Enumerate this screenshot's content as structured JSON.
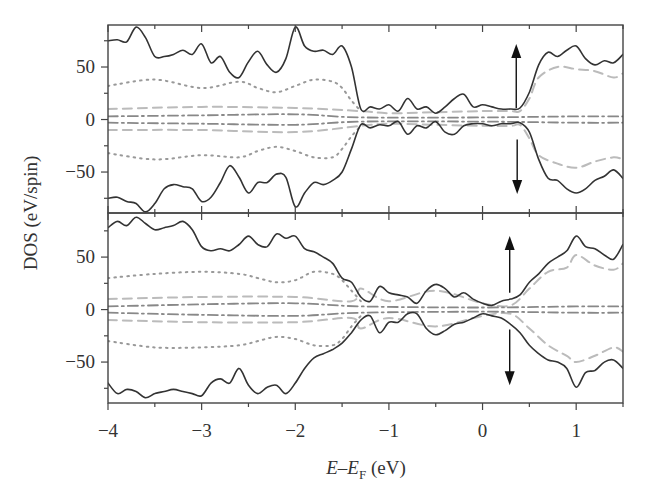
{
  "chart_data": {
    "type": "line",
    "title": "",
    "xlabel": "E–E_F (eV)",
    "xlabel_parts": {
      "e": "E",
      "dash": "–",
      "ef": "E",
      "sub": "F",
      "unit": " (eV)"
    },
    "ylabel": "DOS (eV/spin)",
    "xlim": [
      -4,
      1.5
    ],
    "x_ticks": [
      -4,
      -3,
      -2,
      -1,
      0,
      1
    ],
    "x_tick_labels": [
      "−4",
      "−3",
      "−2",
      "−1",
      "0",
      "1"
    ],
    "grid": false,
    "legend": null,
    "panels": [
      {
        "name": "top",
        "ylim": [
          -89,
          90
        ],
        "y_ticks": [
          50,
          0,
          -50
        ],
        "y_tick_labels": [
          "50",
          "0",
          "−50"
        ],
        "annotations": [
          {
            "type": "arrow-up",
            "x": 0.36,
            "y_from": 11,
            "y_to": 72,
            "label": "spin up"
          },
          {
            "type": "arrow-down",
            "x": 0.37,
            "y_from": -19,
            "y_to": -71,
            "label": "spin down"
          }
        ],
        "series": [
          {
            "name": "total",
            "style": "solid",
            "color": "#333333",
            "x": [
              -4,
              -3.9,
              -3.8,
              -3.7,
              -3.6,
              -3.5,
              -3.4,
              -3.3,
              -3.2,
              -3.1,
              -3.0,
              -2.9,
              -2.8,
              -2.7,
              -2.6,
              -2.5,
              -2.4,
              -2.3,
              -2.2,
              -2.1,
              -2.0,
              -1.9,
              -1.8,
              -1.7,
              -1.6,
              -1.5,
              -1.4,
              -1.3,
              -1.2,
              -1.1,
              -1.0,
              -0.9,
              -0.8,
              -0.7,
              -0.6,
              -0.5,
              -0.4,
              -0.3,
              -0.2,
              -0.1,
              0.0,
              0.1,
              0.2,
              0.3,
              0.4,
              0.5,
              0.6,
              0.7,
              0.8,
              0.9,
              1.0,
              1.1,
              1.2,
              1.3,
              1.4,
              1.5
            ],
            "up": [
              75,
              76,
              74,
              88,
              78,
              60,
              60,
              62,
              66,
              62,
              72,
              54,
              60,
              45,
              40,
              55,
              65,
              52,
              45,
              58,
              88,
              70,
              65,
              66,
              62,
              70,
              50,
              10,
              12,
              10,
              14,
              8,
              20,
              10,
              12,
              6,
              12,
              20,
              24,
              12,
              14,
              12,
              10,
              10,
              11,
              26,
              52,
              64,
              60,
              66,
              70,
              58,
              52,
              56,
              54,
              62
            ],
            "down": [
              -75,
              -74,
              -78,
              -80,
              -88,
              -80,
              -66,
              -62,
              -64,
              -66,
              -78,
              -74,
              -60,
              -44,
              -55,
              -70,
              -60,
              -60,
              -52,
              -55,
              -83,
              -70,
              -60,
              -62,
              -58,
              -50,
              -28,
              -5,
              -8,
              -5,
              -6,
              -2,
              -14,
              -6,
              -8,
              -2,
              -12,
              -14,
              -6,
              -4,
              -4,
              -6,
              -4,
              -4,
              -3,
              -12,
              -38,
              -56,
              -58,
              -66,
              -70,
              -66,
              -58,
              -54,
              -48,
              -56
            ]
          },
          {
            "name": "component-dotted",
            "style": "dotted",
            "color": "#999999",
            "x": [
              -4,
              -3.5,
              -3.0,
              -2.6,
              -2.4,
              -2.2,
              -2.0,
              -1.8,
              -1.6,
              -1.5,
              -1.4,
              -1.3
            ],
            "up": [
              32,
              38,
              30,
              36,
              30,
              26,
              32,
              38,
              36,
              30,
              18,
              8
            ],
            "down": [
              -32,
              -38,
              -34,
              -36,
              -30,
              -26,
              -30,
              -36,
              -36,
              -28,
              -16,
              -6
            ]
          },
          {
            "name": "component-dashed",
            "style": "dashed",
            "color": "#bbbbbb",
            "x": [
              -4,
              -3.0,
              -2.0,
              -1.3,
              -1.0,
              -0.5,
              0.0,
              0.3,
              0.4,
              0.5,
              0.6,
              0.8,
              1.0,
              1.2,
              1.4,
              1.5
            ],
            "up": [
              10,
              12,
              11,
              8,
              6,
              7,
              8,
              8,
              8,
              20,
              40,
              50,
              48,
              46,
              40,
              44
            ],
            "down": [
              -10,
              -10,
              -12,
              -6,
              -4,
              -5,
              -6,
              -6,
              -5,
              -18,
              -34,
              -42,
              -46,
              -40,
              -36,
              -38
            ]
          },
          {
            "name": "component-dashdot",
            "style": "dashdot",
            "color": "#888888",
            "x": [
              -4,
              -3.0,
              -2.0,
              -1.3,
              0.0,
              1.0,
              1.5
            ],
            "up": [
              3,
              4,
              5,
              2,
              2,
              3,
              3
            ],
            "down": [
              -3,
              -4,
              -5,
              -2,
              -2,
              -3,
              -3
            ]
          }
        ]
      },
      {
        "name": "bottom",
        "ylim": [
          -89,
          92
        ],
        "y_ticks": [
          50,
          0,
          -50
        ],
        "y_tick_labels": [
          "50",
          "0",
          "−50"
        ],
        "annotations": [
          {
            "type": "arrow-up",
            "x": 0.29,
            "y_from": 16,
            "y_to": 70,
            "label": "spin up"
          },
          {
            "type": "arrow-down",
            "x": 0.29,
            "y_from": -19,
            "y_to": -72,
            "label": "spin down"
          }
        ],
        "series": [
          {
            "name": "total",
            "style": "solid",
            "color": "#333333",
            "x": [
              -4,
              -3.9,
              -3.8,
              -3.7,
              -3.6,
              -3.5,
              -3.4,
              -3.3,
              -3.2,
              -3.1,
              -3.0,
              -2.9,
              -2.8,
              -2.7,
              -2.6,
              -2.5,
              -2.4,
              -2.3,
              -2.2,
              -2.1,
              -2.0,
              -1.9,
              -1.8,
              -1.7,
              -1.6,
              -1.5,
              -1.4,
              -1.3,
              -1.2,
              -1.1,
              -1.0,
              -0.9,
              -0.8,
              -0.7,
              -0.6,
              -0.5,
              -0.4,
              -0.3,
              -0.2,
              -0.1,
              0.0,
              0.1,
              0.2,
              0.3,
              0.4,
              0.5,
              0.6,
              0.7,
              0.8,
              0.9,
              1.0,
              1.1,
              1.2,
              1.3,
              1.4,
              1.5
            ],
            "up": [
              78,
              84,
              80,
              88,
              82,
              76,
              78,
              80,
              84,
              76,
              60,
              56,
              58,
              56,
              62,
              70,
              62,
              60,
              72,
              68,
              70,
              58,
              55,
              50,
              44,
              30,
              26,
              12,
              8,
              22,
              16,
              14,
              12,
              6,
              18,
              24,
              20,
              12,
              16,
              10,
              6,
              4,
              8,
              10,
              14,
              26,
              34,
              44,
              50,
              56,
              70,
              60,
              58,
              52,
              48,
              62
            ],
            "down": [
              -70,
              -80,
              -76,
              -78,
              -84,
              -80,
              -78,
              -76,
              -78,
              -80,
              -82,
              -70,
              -66,
              -70,
              -56,
              -72,
              -80,
              -74,
              -72,
              -80,
              -70,
              -56,
              -46,
              -42,
              -38,
              -32,
              -22,
              -10,
              -6,
              -22,
              -12,
              -12,
              -4,
              -4,
              -18,
              -24,
              -20,
              -14,
              -12,
              -8,
              -4,
              -6,
              -8,
              -14,
              -22,
              -34,
              -42,
              -48,
              -50,
              -56,
              -74,
              -60,
              -58,
              -50,
              -48,
              -56
            ]
          },
          {
            "name": "component-dotted",
            "style": "dotted",
            "color": "#999999",
            "x": [
              -4,
              -3.5,
              -3.0,
              -2.6,
              -2.4,
              -2.2,
              -2.0,
              -1.8,
              -1.6,
              -1.5,
              -1.4,
              -1.3
            ],
            "up": [
              30,
              34,
              36,
              34,
              30,
              26,
              28,
              36,
              34,
              28,
              18,
              8
            ],
            "down": [
              -30,
              -36,
              -36,
              -34,
              -30,
              -26,
              -28,
              -34,
              -34,
              -28,
              -16,
              -6
            ]
          },
          {
            "name": "component-dashed",
            "style": "dashed",
            "color": "#bbbbbb",
            "x": [
              -4,
              -3.0,
              -2.0,
              -1.4,
              -1.3,
              -1.0,
              -0.5,
              0.0,
              0.3,
              0.5,
              0.7,
              0.9,
              1.0,
              1.2,
              1.4,
              1.5
            ],
            "up": [
              10,
              12,
              12,
              8,
              20,
              8,
              18,
              6,
              4,
              20,
              36,
              40,
              52,
              42,
              38,
              44
            ],
            "down": [
              -10,
              -12,
              -12,
              -8,
              -18,
              -8,
              -16,
              -6,
              -4,
              -18,
              -34,
              -44,
              -50,
              -44,
              -36,
              -40
            ]
          },
          {
            "name": "component-dashdot",
            "style": "dashdot",
            "color": "#888888",
            "x": [
              -4,
              -3.0,
              -2.0,
              -1.3,
              0.0,
              1.0,
              1.5
            ],
            "up": [
              3,
              5,
              6,
              3,
              2,
              3,
              3
            ],
            "down": [
              -3,
              -5,
              -6,
              -3,
              -2,
              -3,
              -3
            ]
          }
        ]
      }
    ]
  }
}
